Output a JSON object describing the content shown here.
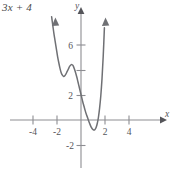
{
  "figure": {
    "corner_label": "3x + 4",
    "background_color": "#ffffff",
    "curve_color": "#6f7074",
    "axis_color": "#8d8d92",
    "text_color": "#55555a"
  },
  "axes": {
    "x_axis_name": "x",
    "y_axis_name": "y",
    "x_tick_labels": [
      "-4",
      "-2",
      "2",
      "4"
    ],
    "y_tick_labels": [
      "6",
      "2",
      "-2"
    ]
  },
  "chart_data": {
    "type": "line",
    "title": "3x + 4",
    "xlabel": "x",
    "ylabel": "y",
    "xlim": [
      -5.0,
      5.4
    ],
    "ylim": [
      -3.0,
      8.4
    ],
    "xticks": [
      -4,
      -2,
      2,
      4
    ],
    "xticklabels": [
      "-4",
      "-2",
      "2",
      "4"
    ],
    "yticks": [
      6,
      4,
      2,
      -2
    ],
    "yticklabels": [
      "6",
      "",
      "2",
      "-2"
    ],
    "grid": false,
    "legend": null,
    "series": [
      {
        "name": "curve",
        "x": [
          -2.45,
          -2.35,
          -2.25,
          -2.15,
          -2.05,
          -1.95,
          -1.85,
          -1.75,
          -1.65,
          -1.55,
          -1.45,
          -1.35,
          -1.25,
          -1.15,
          -1.05,
          -0.95,
          -0.85,
          -0.75,
          -0.65,
          -0.55,
          -0.45,
          -0.35,
          -0.25,
          -0.15,
          -0.05,
          0.05,
          0.15,
          0.25,
          0.35,
          0.45,
          0.55,
          0.65,
          0.75,
          0.85,
          0.95,
          1.05,
          1.15,
          1.25,
          1.35,
          1.45,
          1.55,
          1.65,
          1.75,
          1.85,
          1.95
        ],
        "y": [
          8.3,
          7.6,
          6.9,
          6.3,
          5.7,
          5.1,
          4.6,
          4.15,
          3.8,
          3.6,
          3.5,
          3.55,
          3.7,
          3.9,
          4.1,
          4.3,
          4.42,
          4.45,
          4.35,
          4.1,
          3.8,
          3.45,
          3.05,
          2.65,
          2.25,
          1.85,
          1.45,
          1.1,
          0.75,
          0.45,
          0.18,
          -0.1,
          -0.35,
          -0.58,
          -0.72,
          -0.8,
          -0.78,
          -0.62,
          -0.3,
          0.2,
          0.95,
          1.95,
          3.3,
          5.1,
          7.4
        ]
      }
    ],
    "features": {
      "local_min_left": {
        "x": -1.45,
        "y": 3.5
      },
      "local_max": {
        "x": -0.75,
        "y": 4.45
      },
      "local_min_right": {
        "x": 1.05,
        "y": -0.8
      },
      "x_intercepts_approx": [
        0.6,
        1.42
      ],
      "y_intercept_approx": 2.05
    }
  }
}
